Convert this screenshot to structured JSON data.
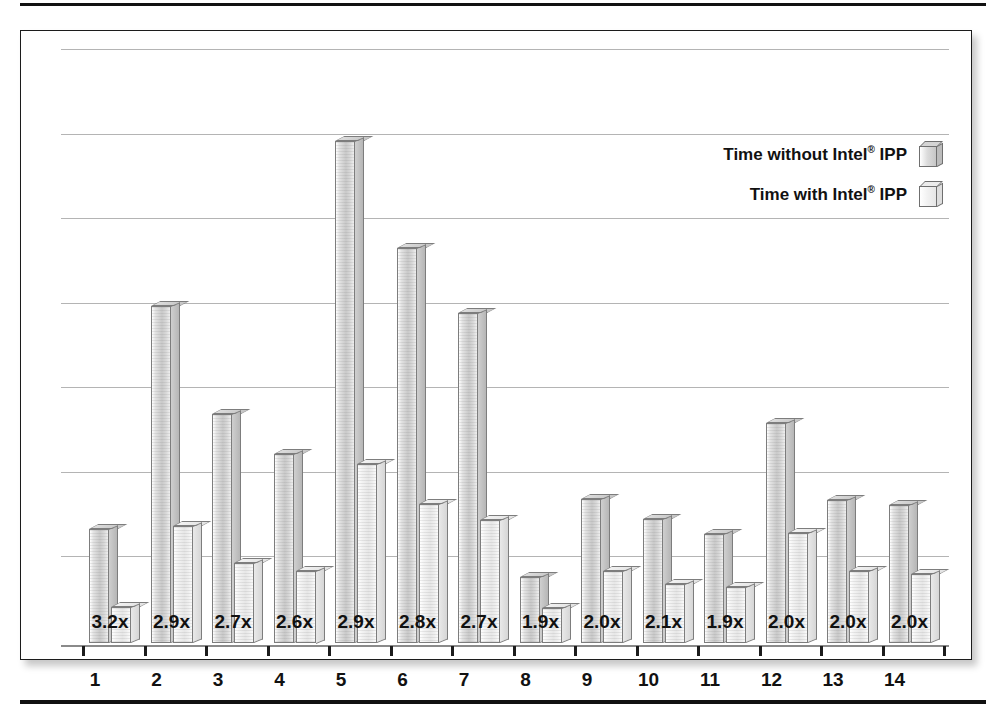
{
  "chart_data": {
    "type": "bar",
    "title": "",
    "subtitle": "",
    "xlabel": "",
    "ylabel": "",
    "grid": true,
    "gridlines": 7,
    "legend_position": "top-right",
    "categories": [
      "1",
      "2",
      "3",
      "4",
      "5",
      "6",
      "7",
      "8",
      "9",
      "10",
      "11",
      "12",
      "13",
      "14"
    ],
    "series": [
      {
        "name": "Time without Intel® IPP",
        "key": "without",
        "values": [
          121,
          358,
          243,
          201,
          533,
          419,
          350,
          70,
          153,
          132,
          116,
          234,
          152,
          147
        ]
      },
      {
        "name": "Time with Intel® IPP",
        "key": "with",
        "values": [
          38,
          124,
          85,
          77,
          190,
          148,
          131,
          37,
          76,
          63,
          59,
          117,
          76,
          73
        ]
      }
    ],
    "point_labels": [
      "3.2x",
      "2.9x",
      "2.7x",
      "2.6x",
      "2.9x",
      "2.8x",
      "2.7x",
      "1.9x",
      "2.0x",
      "2.1x",
      "1.9x",
      "2.0x",
      "2.0x",
      "2.0x"
    ],
    "ylim": [
      0,
      600
    ],
    "ytick_labels": []
  },
  "legend": {
    "entries": [
      {
        "label_pre": "Time without Intel",
        "sup": "®",
        "label_post": " IPP",
        "swatch": "bar-swatch-dark"
      },
      {
        "label_pre": "Time with Intel",
        "sup": "®",
        "label_post": " IPP",
        "swatch": "bar-swatch-light"
      }
    ]
  },
  "colors": {
    "frame_border": "#1c1c1c",
    "gridline": "#b4b4b4",
    "axis": "#8a8a8a",
    "bar_without": "#c9c9c9",
    "bar_with": "#e7e7e7",
    "text": "#111111",
    "page_background": "#ffffff"
  },
  "rules": {
    "top": "horizontal-rule-top",
    "bottom": "horizontal-rule-bottom"
  }
}
